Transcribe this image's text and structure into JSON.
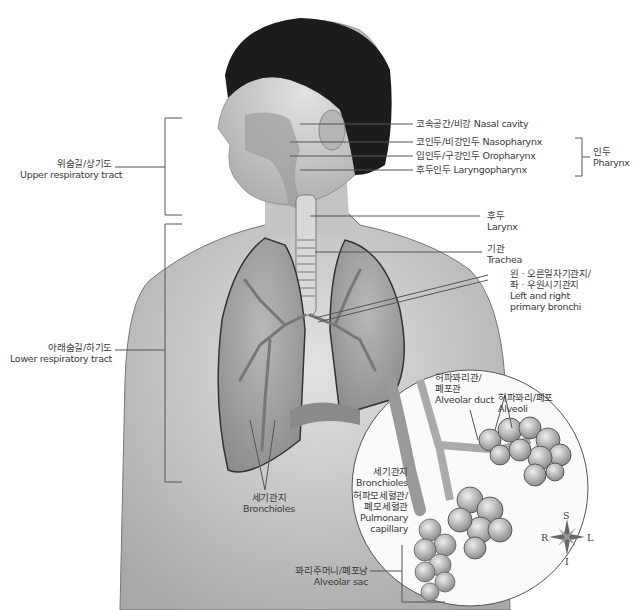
{
  "figure": {
    "orientation_compass": {
      "S": "S",
      "I": "I",
      "R": "R",
      "L": "L"
    },
    "colors": {
      "skin": "#cfcfcf",
      "hair": "#1a1a1a",
      "lung": "#9a9a9a",
      "line": "#555555",
      "text": "#3a3a3a"
    }
  },
  "labels": {
    "upper_tract": {
      "ko": "위숨길/상기도",
      "en": "Upper respiratory tract"
    },
    "lower_tract": {
      "ko": "아래숨길/하기도",
      "en": "Lower respiratory tract"
    },
    "nasal_cavity": {
      "text": "코속공간/비강 Nasal cavity"
    },
    "nasopharynx": {
      "text": "코인두/비강인두 Nasopharynx"
    },
    "oropharynx": {
      "text": "입인두/구강인두 Oropharynx"
    },
    "laryngopharynx": {
      "text": "후두인두 Laryngopharynx"
    },
    "pharynx": {
      "ko": "인두",
      "en": "Pharynx"
    },
    "larynx": {
      "ko": "후두",
      "en": "Larynx"
    },
    "trachea": {
      "ko": "기관",
      "en": "Trachea"
    },
    "primary_bronchi": {
      "ko1": "왼 · 오른일차기관지/",
      "ko2": "좌 · 우원시기관지",
      "en1": "Left and right",
      "en2": "primary bronchi"
    },
    "alveolar_duct": {
      "ko1": "허파꽈리관/",
      "ko2": "폐포관",
      "en": "Alveolar duct"
    },
    "alveoli": {
      "ko": "허파꽈리/폐포",
      "en": "Alveoli"
    },
    "bronchioles_inset": {
      "ko": "세기관지",
      "en": "Bronchioles"
    },
    "pulmonary_capillary": {
      "ko1": "허파모세혈관/",
      "ko2": "폐모세혈관",
      "en1": "Pulmonary",
      "en2": "capillary"
    },
    "bronchioles_lung": {
      "ko": "세기관지",
      "en": "Bronchioles"
    },
    "alveolar_sac": {
      "ko": "꽈리주머니/폐포낭",
      "en": "Alveolar sac"
    }
  }
}
